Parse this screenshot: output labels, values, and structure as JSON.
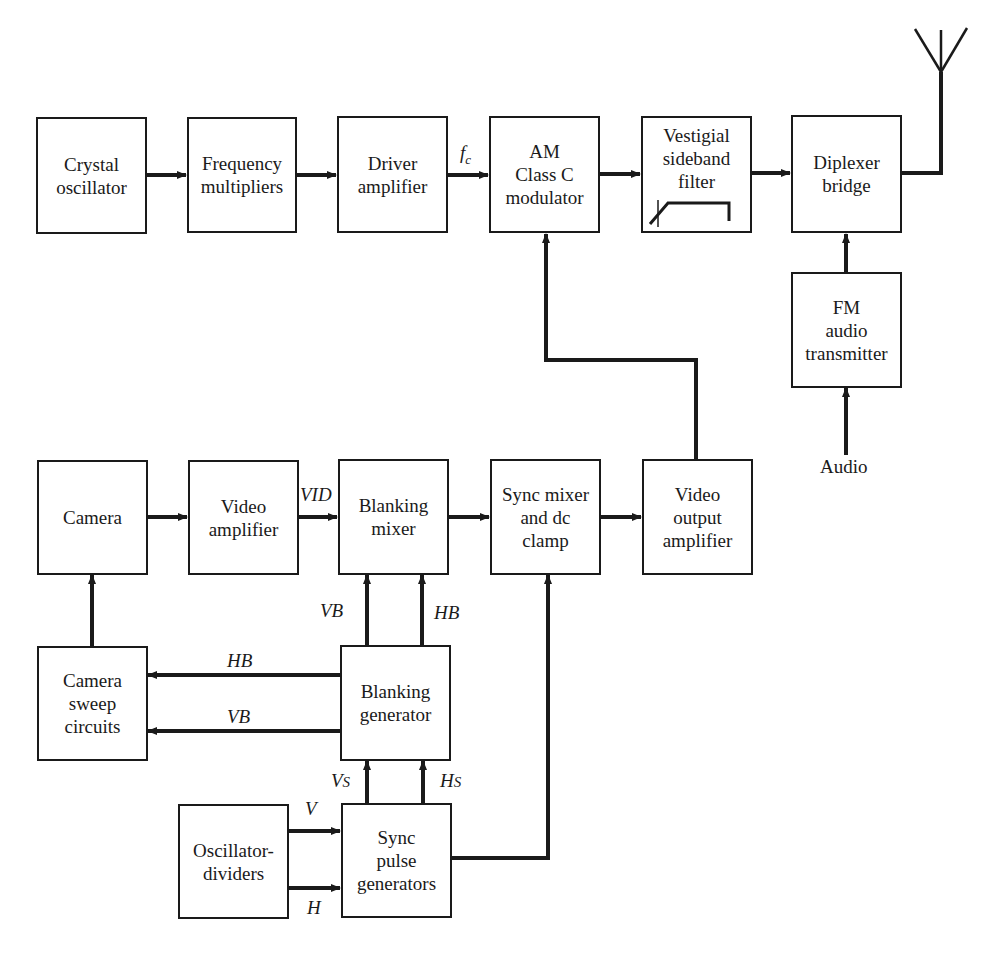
{
  "diagram": {
    "type": "block-diagram",
    "blocks": {
      "crystal_osc": {
        "lines": [
          "Crystal",
          "oscillator"
        ]
      },
      "freq_mult": {
        "lines": [
          "Frequency",
          "multipliers"
        ]
      },
      "driver_amp": {
        "lines": [
          "Driver",
          "amplifier"
        ]
      },
      "am_mod": {
        "lines": [
          "AM",
          "Class C",
          "modulator"
        ]
      },
      "vsb_filter": {
        "lines": [
          "Vestigial",
          "sideband",
          "filter"
        ]
      },
      "diplexer": {
        "lines": [
          "Diplexer",
          "bridge"
        ]
      },
      "fm_audio": {
        "lines": [
          "FM",
          "audio",
          "transmitter"
        ]
      },
      "camera": {
        "lines": [
          "Camera"
        ]
      },
      "video_amp": {
        "lines": [
          "Video",
          "amplifier"
        ]
      },
      "blanking_mixer": {
        "lines": [
          "Blanking",
          "mixer"
        ]
      },
      "sync_mixer": {
        "lines": [
          "Sync mixer",
          "and dc",
          "clamp"
        ]
      },
      "video_out": {
        "lines": [
          "Video",
          "output",
          "amplifier"
        ]
      },
      "camera_sweep": {
        "lines": [
          "Camera",
          "sweep",
          "circuits"
        ]
      },
      "blanking_gen": {
        "lines": [
          "Blanking",
          "generator"
        ]
      },
      "osc_dividers": {
        "lines": [
          "Oscillator-",
          "dividers"
        ]
      },
      "sync_pulse": {
        "lines": [
          "Sync",
          "pulse",
          "generators"
        ]
      }
    },
    "signal_labels": {
      "fc": "f",
      "fc_sub": "c",
      "vid": "VID",
      "vb_up": "VB",
      "hb_up": "HB",
      "hb_left": "HB",
      "vb_left": "VB",
      "vs": "V",
      "vs_sub": "S",
      "hs": "H",
      "hs_sub": "S",
      "v": "V",
      "h": "H",
      "audio": "Audio"
    },
    "connections": [
      {
        "from": "Crystal oscillator",
        "to": "Frequency multipliers"
      },
      {
        "from": "Frequency multipliers",
        "to": "Driver amplifier"
      },
      {
        "from": "Driver amplifier",
        "to": "AM Class C modulator",
        "label": "fc"
      },
      {
        "from": "AM Class C modulator",
        "to": "Vestigial sideband filter"
      },
      {
        "from": "Vestigial sideband filter",
        "to": "Diplexer bridge"
      },
      {
        "from": "Diplexer bridge",
        "to": "Antenna"
      },
      {
        "from": "FM audio transmitter",
        "to": "Diplexer bridge"
      },
      {
        "from": "Audio",
        "to": "FM audio transmitter"
      },
      {
        "from": "Camera",
        "to": "Video amplifier"
      },
      {
        "from": "Video amplifier",
        "to": "Blanking mixer",
        "label": "VID"
      },
      {
        "from": "Blanking mixer",
        "to": "Sync mixer and dc clamp"
      },
      {
        "from": "Sync mixer and dc clamp",
        "to": "Video output amplifier"
      },
      {
        "from": "Video output amplifier",
        "to": "AM Class C modulator"
      },
      {
        "from": "Camera sweep circuits",
        "to": "Camera"
      },
      {
        "from": "Blanking generator",
        "to": "Blanking mixer",
        "label": "VB"
      },
      {
        "from": "Blanking generator",
        "to": "Blanking mixer",
        "label": "HB"
      },
      {
        "from": "Blanking generator",
        "to": "Camera sweep circuits",
        "label": "HB"
      },
      {
        "from": "Blanking generator",
        "to": "Camera sweep circuits",
        "label": "VB"
      },
      {
        "from": "Sync pulse generators",
        "to": "Blanking generator",
        "label": "Vs"
      },
      {
        "from": "Sync pulse generators",
        "to": "Blanking generator",
        "label": "Hs"
      },
      {
        "from": "Oscillator-dividers",
        "to": "Sync pulse generators",
        "label": "V"
      },
      {
        "from": "Oscillator-dividers",
        "to": "Sync pulse generators",
        "label": "H"
      },
      {
        "from": "Sync pulse generators",
        "to": "Sync mixer and dc clamp"
      }
    ]
  }
}
